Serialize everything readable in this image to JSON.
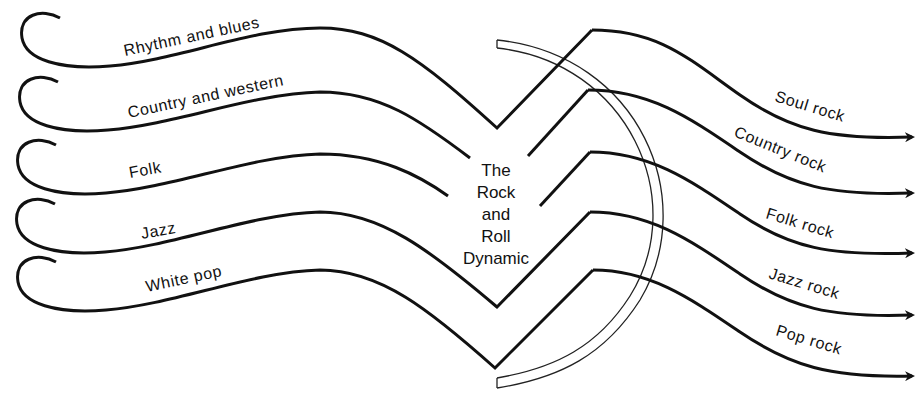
{
  "diagram": {
    "title_lines": [
      "The",
      "Rock",
      "and",
      "Roll",
      "Dynamic"
    ],
    "inputs": [
      {
        "label": "Rhythm and blues"
      },
      {
        "label": "Country and western"
      },
      {
        "label": "Folk"
      },
      {
        "label": "Jazz"
      },
      {
        "label": "White pop"
      }
    ],
    "outputs": [
      {
        "label": "Soul rock"
      },
      {
        "label": "Country rock"
      },
      {
        "label": "Folk rock"
      },
      {
        "label": "Jazz rock"
      },
      {
        "label": "Pop rock"
      }
    ],
    "colors": {
      "line": "#111111",
      "background": "#ffffff"
    }
  }
}
